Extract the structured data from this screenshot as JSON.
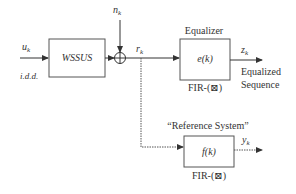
{
  "diagram": {
    "input": {
      "symbol": "u",
      "subscript": "k",
      "note": "i.d.d."
    },
    "channel": {
      "label": "WSSUS"
    },
    "noise": {
      "symbol": "n",
      "subscript": "k"
    },
    "sum_junction": {
      "glyph": "⊕"
    },
    "received": {
      "symbol": "r",
      "subscript": "k"
    },
    "equalizer": {
      "title": "Equalizer",
      "label": "e(k)",
      "type": "FIR-(⊠)"
    },
    "equalizer_output": {
      "symbol": "z",
      "subscript": "k",
      "line1": "Equalized",
      "line2": "Sequence"
    },
    "reference": {
      "title": "“Reference System”",
      "label": "f(k)",
      "type": "FIR-(⊠)"
    },
    "reference_output": {
      "symbol": "y",
      "subscript": "k"
    }
  },
  "colors": {
    "line": "#333333",
    "text": "#333333",
    "background": "#ffffff"
  }
}
